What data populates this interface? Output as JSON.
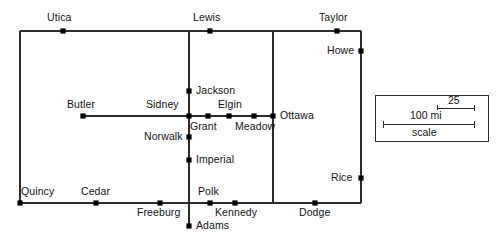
{
  "map": {
    "name": "county-road-network-map",
    "background_color": "#ffffff",
    "line_color": "#2b2b2b",
    "marker_color": "#000000",
    "cities": [
      {
        "id": "utica",
        "label": "Utica",
        "x": 63,
        "y": 31,
        "label_x": 47,
        "label_y": 12
      },
      {
        "id": "lewis",
        "label": "Lewis",
        "x": 210,
        "y": 31,
        "label_x": 193,
        "label_y": 12
      },
      {
        "id": "taylor",
        "label": "Taylor",
        "x": 337,
        "y": 31,
        "label_x": 319,
        "label_y": 12
      },
      {
        "id": "howe",
        "label": "Howe",
        "x": 361,
        "y": 51,
        "label_x": 327,
        "label_y": 45
      },
      {
        "id": "jackson",
        "label": "Jackson",
        "x": 189,
        "y": 91,
        "label_x": 196,
        "label_y": 85
      },
      {
        "id": "butler",
        "label": "Butler",
        "x": 83,
        "y": 116,
        "label_x": 67,
        "label_y": 99
      },
      {
        "id": "sidney",
        "label": "Sidney",
        "x": 189,
        "y": 116,
        "label_x": 146,
        "label_y": 99
      },
      {
        "id": "grant",
        "label": "Grant",
        "x": 208,
        "y": 116,
        "label_x": 190,
        "label_y": 121
      },
      {
        "id": "elgin",
        "label": "Elgin",
        "x": 229,
        "y": 116,
        "label_x": 218,
        "label_y": 99
      },
      {
        "id": "meadow",
        "label": "Meadow",
        "x": 254,
        "y": 116,
        "label_x": 235,
        "label_y": 121
      },
      {
        "id": "ottawa",
        "label": "Ottawa",
        "x": 273,
        "y": 116,
        "label_x": 280,
        "label_y": 110
      },
      {
        "id": "norwalk",
        "label": "Norwalk",
        "x": 189,
        "y": 137,
        "label_x": 144,
        "label_y": 131
      },
      {
        "id": "imperial",
        "label": "Imperial",
        "x": 189,
        "y": 160,
        "label_x": 196,
        "label_y": 154
      },
      {
        "id": "rice",
        "label": "Rice",
        "x": 361,
        "y": 178,
        "label_x": 331,
        "label_y": 172
      },
      {
        "id": "quincy",
        "label": "Quincy",
        "x": 20,
        "y": 203,
        "label_x": 21,
        "label_y": 186
      },
      {
        "id": "cedar",
        "label": "Cedar",
        "x": 96,
        "y": 203,
        "label_x": 81,
        "label_y": 186
      },
      {
        "id": "freeburg",
        "label": "Freeburg",
        "x": 160,
        "y": 203,
        "label_x": 137,
        "label_y": 207
      },
      {
        "id": "polk",
        "label": "Polk",
        "x": 210,
        "y": 203,
        "label_x": 198,
        "label_y": 186
      },
      {
        "id": "kennedy",
        "label": "Kennedy",
        "x": 235,
        "y": 203,
        "label_x": 215,
        "label_y": 207
      },
      {
        "id": "dodge",
        "label": "Dodge",
        "x": 315,
        "y": 203,
        "label_x": 299,
        "label_y": 207
      },
      {
        "id": "adams",
        "label": "Adams",
        "x": 189,
        "y": 226,
        "label_x": 196,
        "label_y": 220
      }
    ],
    "roads": [
      {
        "id": "road-top",
        "x1": 20,
        "y1": 31,
        "x2": 361,
        "y2": 31
      },
      {
        "id": "road-bottom",
        "x1": 20,
        "y1": 203,
        "x2": 361,
        "y2": 203
      },
      {
        "id": "road-left",
        "x1": 20,
        "y1": 31,
        "x2": 20,
        "y2": 203
      },
      {
        "id": "road-right",
        "x1": 361,
        "y1": 31,
        "x2": 361,
        "y2": 203
      },
      {
        "id": "road-central-vert",
        "x1": 189,
        "y1": 31,
        "x2": 189,
        "y2": 226
      },
      {
        "id": "road-ottawa-vert",
        "x1": 273,
        "y1": 31,
        "x2": 273,
        "y2": 203
      },
      {
        "id": "road-butler-ottawa",
        "x1": 83,
        "y1": 116,
        "x2": 273,
        "y2": 116
      }
    ]
  },
  "scale_box": {
    "name": "map-scale-legend",
    "long_label": "100 mi",
    "short_label": "25",
    "caption": "scale",
    "box": {
      "x": 375,
      "y": 95,
      "width": 113,
      "height": 46
    },
    "long_bar": {
      "x1": 383,
      "y1": 124,
      "x2": 474,
      "y2": 124
    },
    "short_bar": {
      "x1": 437,
      "y1": 108,
      "x2": 474,
      "y2": 108
    }
  }
}
